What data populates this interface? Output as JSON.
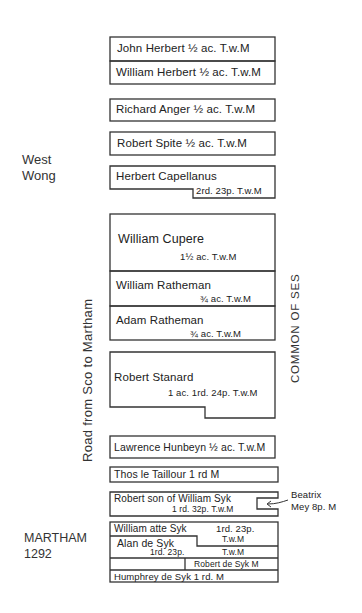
{
  "title": "MARTHAM 1292",
  "labels": {
    "west_wong_1": "West",
    "west_wong_2": "Wong",
    "martham": "MARTHAM",
    "year": "1292",
    "road": "Road  from  Sco  to  Martham",
    "common": "COMMON  OF  SES",
    "beatrix_1": "Beatrix",
    "beatrix_2": "Mey 8p. M"
  },
  "plots": [
    {
      "name": "John Herbert",
      "area": "1/2 ac.",
      "tenure": "T.w.M"
    },
    {
      "name": "William Herbert",
      "area": "1/2 ac.",
      "tenure": "T.w.M"
    },
    {
      "name": "Richard Anger",
      "area": "1/2 ac.",
      "tenure": "T.w.M"
    },
    {
      "name": "Robert Spite",
      "area": "1/2 ac.",
      "tenure": "T.w.M"
    },
    {
      "name": "Herbert Capellanus",
      "area": "2rd. 23p.",
      "tenure": "T.w.M"
    },
    {
      "name": "William Cupere",
      "area": "1½ ac.",
      "tenure": "T.w.M"
    },
    {
      "name": "William Ratheman",
      "area": "3/4 ac.",
      "tenure": "T.w.M"
    },
    {
      "name": "Adam Ratheman",
      "area": "3/4 ac.",
      "tenure": "T.w.M"
    },
    {
      "name": "Robert Stanard",
      "area": "1 ac. 1rd. 24p.",
      "tenure": "T.w.M"
    },
    {
      "name": "Lawrence Hunbeyn",
      "area": "1/2 ac.",
      "tenure": "T.w.M"
    },
    {
      "name": "Thos le Taillour",
      "area": "1 rd",
      "tenure": "M"
    },
    {
      "name": "Robert son of William Syk",
      "area": "1 rd. 32p.",
      "tenure": "T.w.M"
    },
    {
      "name": "William atte Syk",
      "area": "1rd. 23p.",
      "tenure": "T.w.M"
    },
    {
      "name": "Alan de Syk",
      "area": "1rd. 23p.",
      "tenure": "T.w.M"
    },
    {
      "name": "Robert de Syk",
      "area": "",
      "tenure": "M"
    },
    {
      "name": "Humphrey de Syk",
      "area": "1 rd.",
      "tenure": "M"
    }
  ],
  "display": {
    "p0": "John Herbert  ½ ac.   T.w.M",
    "p1": "William Herbert ½ ac.  T.w.M",
    "p2": "Richard Anger  ½ ac.   T.w.M",
    "p3": "Robert Spite   ½ ac.   T.w.M",
    "p4_name": "Herbert Capellanus",
    "p4_val": "2rd. 23p. T.w.M",
    "p5_name": "William Cupere",
    "p5_val": "1½ ac.     T.w.M",
    "p6_name": "William Ratheman",
    "p6_val": "¾ ac.   T.w.M",
    "p7_name": "Adam Ratheman",
    "p7_val": "¾ ac.    T.w.M",
    "p8_name": "Robert Stanard",
    "p8_val": "1 ac. 1rd. 24p. T.w.M",
    "p9": "Lawrence Hunbeyn ½ ac. T.w.M",
    "p10": "Thos le Taillour  1 rd      M",
    "p11_name": "Robert son of William Syk",
    "p11_val": "1 rd. 32p. T.w.M",
    "p12_name": "William atte Syk",
    "p12_area": "1rd. 23p.",
    "p12_ten": "T.w.M",
    "p13_name": "Alan de Syk",
    "p13_area": "1rd.  23p.",
    "p13_ten": "T.w.M",
    "p14": "Robert de Syk  M",
    "p15": "Humphrey de Syk  1 rd.    M"
  }
}
